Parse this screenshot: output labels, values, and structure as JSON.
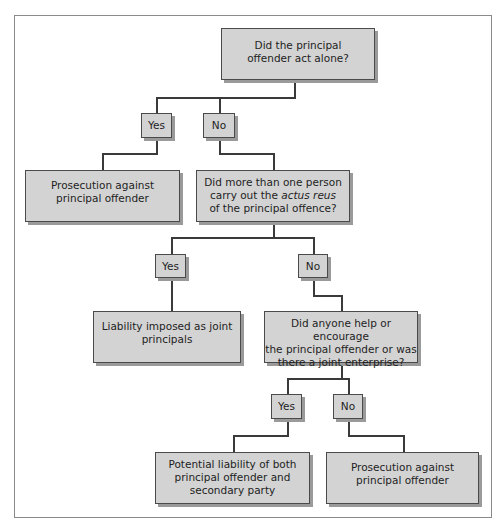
{
  "diagram": {
    "nodes": {
      "q1": {
        "lines": [
          "Did the principal",
          "offender act alone?"
        ]
      },
      "q1_yes": {
        "label": "Yes"
      },
      "q1_no": {
        "label": "No"
      },
      "r1": {
        "lines": [
          "Prosecution against",
          "principal offender"
        ]
      },
      "q2": {
        "line1": "Did more than one person",
        "line2_pre": "carry out the ",
        "line2_em": "actus reus",
        "line3": "of the principal offence?"
      },
      "q2_yes": {
        "label": "Yes"
      },
      "q2_no": {
        "label": "No"
      },
      "r2": {
        "lines": [
          "Liability imposed as joint",
          "principals"
        ]
      },
      "q3": {
        "lines": [
          "Did anyone help or encourage",
          "the principal offender or was",
          "there a joint enterprise?"
        ]
      },
      "q3_yes": {
        "label": "Yes"
      },
      "q3_no": {
        "label": "No"
      },
      "r3": {
        "lines": [
          "Potential liability of both",
          "principal offender and",
          "secondary party"
        ]
      },
      "r4": {
        "lines": [
          "Prosecution against",
          "principal offender"
        ]
      }
    },
    "edges": [
      {
        "from": "q1",
        "to": "q1_yes"
      },
      {
        "from": "q1",
        "to": "q1_no"
      },
      {
        "from": "q1_yes",
        "to": "r1"
      },
      {
        "from": "q1_no",
        "to": "q2"
      },
      {
        "from": "q2",
        "to": "q2_yes"
      },
      {
        "from": "q2",
        "to": "q2_no"
      },
      {
        "from": "q2_yes",
        "to": "r2"
      },
      {
        "from": "q2_no",
        "to": "q3"
      },
      {
        "from": "q3",
        "to": "q3_yes"
      },
      {
        "from": "q3",
        "to": "q3_no"
      },
      {
        "from": "q3_yes",
        "to": "r3"
      },
      {
        "from": "q3_no",
        "to": "r4"
      }
    ],
    "colors": {
      "box_fill": "#d3d3d3",
      "box_border": "#4a4a4a",
      "shadow": "#9a9a9a",
      "line": "#3a3a3a"
    }
  }
}
